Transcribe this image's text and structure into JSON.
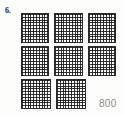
{
  "problem": {
    "number_label": "6.",
    "answer": "800"
  },
  "base_ten_blocks": {
    "unit_name": "hundred-flat",
    "grid_rows": 10,
    "grid_cols": 10,
    "value_per_block": 100,
    "total_blocks": 8,
    "rows": [
      {
        "count": 3,
        "blocks": [
          "hundred-flat",
          "hundred-flat",
          "hundred-flat"
        ]
      },
      {
        "count": 3,
        "blocks": [
          "hundred-flat",
          "hundred-flat",
          "hundred-flat"
        ]
      },
      {
        "count": 2,
        "blocks": [
          "hundred-flat",
          "hundred-flat"
        ]
      }
    ]
  },
  "colors": {
    "background": "#fdfdfb",
    "grid_line": "#191919",
    "block_border": "#2b2b2b",
    "answer_text": "#8d8d8d",
    "number_text": "#1a1a1a"
  }
}
